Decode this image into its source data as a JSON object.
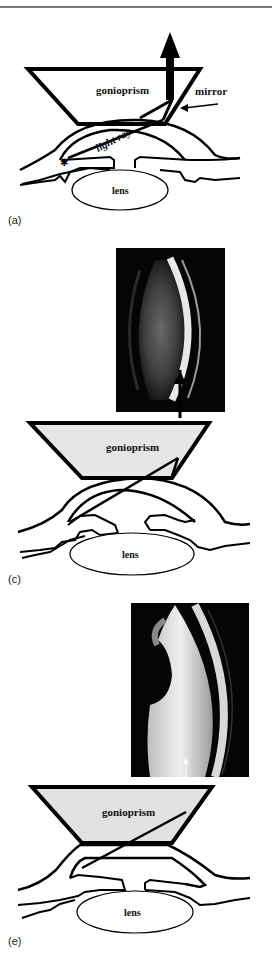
{
  "figure": {
    "panels": [
      {
        "id": "a",
        "caption": "(a)",
        "labels": {
          "prism": "gonioprism",
          "mirror": "mirror",
          "ray": "light ray",
          "lens": "lens"
        }
      },
      {
        "id": "c",
        "caption": "(c)",
        "labels": {
          "prism": "gonioprism",
          "lens": "lens"
        },
        "photo": "gonioscopy-photo-angle-view"
      },
      {
        "id": "e",
        "caption": "(e)",
        "labels": {
          "prism": "gonioprism",
          "lens": "lens"
        },
        "photo": "gonioscopy-photo-closed-angle-view"
      }
    ],
    "colors": {
      "line": "#000000",
      "prism_fill_c": "#e6e6e6",
      "prism_fill_e": "#e2e2e2",
      "rule": "#7a7a7a"
    }
  }
}
